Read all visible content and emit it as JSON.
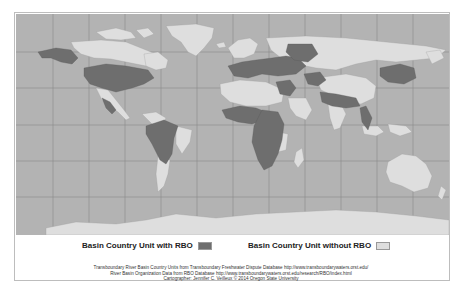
{
  "map": {
    "projection": "equirectangular world map with graticule",
    "colors": {
      "ocean": "#b3b3b3",
      "with_rbo": "#6e6e6e",
      "without_rbo": "#dedede",
      "graticule": "#8c8c8c",
      "border": "#bdbdbd"
    },
    "graticule": {
      "vertical_x": [
        53,
        89,
        125,
        161,
        197,
        233,
        269,
        305,
        341,
        377,
        413
      ],
      "horizontal_y": [
        52,
        88,
        125,
        161,
        197
      ]
    }
  },
  "legend": {
    "items": [
      {
        "label": "Basin Country Unit with RBO",
        "color": "#6e6e6e"
      },
      {
        "label": "Basin Country Unit without RBO",
        "color": "#dedede"
      }
    ]
  },
  "credits": {
    "line1": "Transboundary River Basin Country Units from Transboundary Freshwater Dispute Database http://www.transboundarywaters.orst.edu/",
    "line2": "River Basin Organization Data from RBO Database http://www.transboundarywaters.orst.edu/research/RBO/index.html",
    "line3": "Cartographer: Jennifer C. Veilleux © 2014 Oregon State University"
  }
}
